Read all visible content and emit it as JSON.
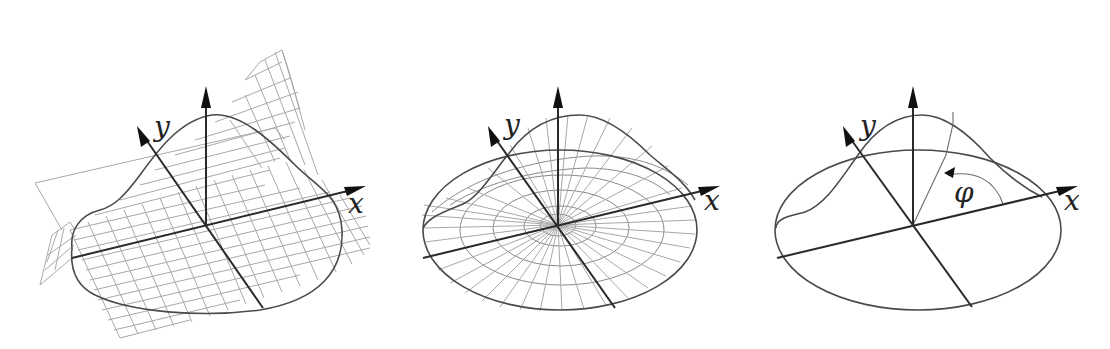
{
  "figures": [
    {
      "id": "cartesian-grid-surface",
      "axes": {
        "x_label": "x",
        "y_label": "y",
        "z_label": ""
      },
      "mesh": "rectangular-grid",
      "description": "Bell-shaped surface over a rectangular grid with a saddle-like sheet"
    },
    {
      "id": "polar-grid-surface",
      "axes": {
        "x_label": "x",
        "y_label": "y",
        "z_label": ""
      },
      "mesh": "polar-grid",
      "description": "Bell-shaped surface over an elliptical base with radial and circular grid lines"
    },
    {
      "id": "polar-angle-surface",
      "axes": {
        "x_label": "x",
        "y_label": "y",
        "z_label": ""
      },
      "angle_label": "φ",
      "mesh": "none",
      "description": "Bell-shaped surface over an elliptical base showing polar angle φ"
    }
  ],
  "colors": {
    "background": "#ffffff",
    "axis": "#2a2a2a",
    "curve": "#4a4a4a",
    "grid": "#a8a8a8"
  }
}
